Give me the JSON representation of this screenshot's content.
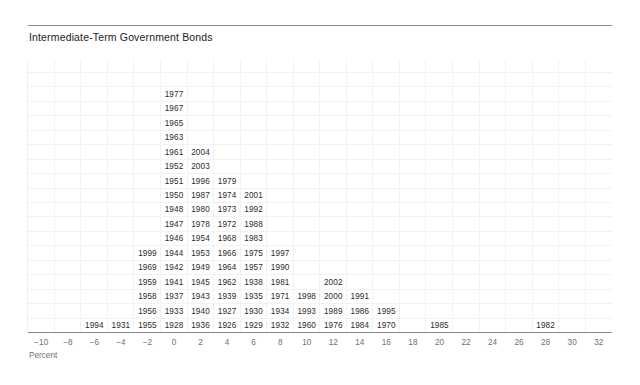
{
  "chart_title": "Intermediate-Term Government Bonds",
  "axis": {
    "caption": "Percent",
    "tick_labels": [
      "−10",
      "−8",
      "−6",
      "−4",
      "−2",
      "0",
      "2",
      "4",
      "6",
      "8",
      "10",
      "12",
      "14",
      "16",
      "18",
      "20",
      "22",
      "24",
      "26",
      "28",
      "30",
      "32"
    ],
    "min": -10,
    "max": 32,
    "step": 2
  },
  "colors": {
    "text": "#2b2b2b",
    "title": "#1c1c1c",
    "axis": "#888888",
    "tick": "#6f6f6f",
    "grid": "#f2f2f4",
    "background": "#ffffff"
  },
  "chart_data": {
    "type": "bar",
    "title": "Intermediate-Term Government Bonds",
    "subtitle": "",
    "xlabel": "Percent",
    "ylabel": "",
    "xlim": [
      -11,
      33
    ],
    "grid": true,
    "legend": "none",
    "note": "Stacked-year histogram: each annual return is printed as a year label stacked within its 2-percent-wide bin.",
    "bin_width": 2,
    "categories": [
      "−10",
      "−8",
      "−6",
      "−4",
      "−2",
      "0",
      "2",
      "4",
      "6",
      "8",
      "10",
      "12",
      "14",
      "16",
      "18",
      "20",
      "22",
      "24",
      "26",
      "28",
      "30",
      "32"
    ],
    "bin_centers": [
      -10,
      -8,
      -6,
      -4,
      -2,
      0,
      2,
      4,
      6,
      8,
      10,
      12,
      14,
      16,
      18,
      20,
      22,
      24,
      26,
      28,
      30,
      32
    ],
    "values": [
      0,
      0,
      1,
      1,
      7,
      17,
      11,
      10,
      8,
      7,
      5,
      4,
      3,
      2,
      1,
      0,
      1,
      0,
      0,
      0,
      0,
      1
    ],
    "bins": [
      {
        "center": -10,
        "years": []
      },
      {
        "center": -8,
        "years": []
      },
      {
        "center": -6,
        "years": [
          "1994"
        ]
      },
      {
        "center": -4,
        "years": [
          "1931"
        ]
      },
      {
        "center": -2,
        "years": [
          "1999",
          "1969",
          "1959",
          "1958",
          "1956",
          "1955"
        ]
      },
      {
        "center": 0,
        "years": [
          "1977",
          "1967",
          "1965",
          "1963",
          "1961",
          "1952",
          "1951",
          "1950",
          "1948",
          "1947",
          "1946",
          "1944",
          "1942",
          "1941",
          "1937",
          "1933",
          "1928"
        ]
      },
      {
        "center": 2,
        "years": [
          "2004",
          "2003",
          "1996",
          "1987",
          "1980",
          "1978",
          "1954",
          "1953",
          "1949",
          "1945",
          "1943",
          "1940",
          "1936"
        ]
      },
      {
        "center": 4,
        "years": [
          "1979",
          "1974",
          "1973",
          "1972",
          "1968",
          "1966",
          "1964",
          "1962",
          "1939",
          "1927",
          "1926"
        ]
      },
      {
        "center": 6,
        "years": [
          "2001",
          "1992",
          "1988",
          "1983",
          "1975",
          "1957",
          "1938",
          "1935",
          "1930",
          "1929"
        ]
      },
      {
        "center": 8,
        "years": [
          "1997",
          "1990",
          "1981",
          "1971",
          "1934",
          "1932"
        ]
      },
      {
        "center": 10,
        "years": [
          "1998",
          "1993",
          "1960"
        ]
      },
      {
        "center": 12,
        "years": [
          "2002",
          "2000",
          "1989",
          "1976"
        ]
      },
      {
        "center": 14,
        "years": [
          "1991",
          "1986",
          "1984"
        ]
      },
      {
        "center": 16,
        "years": [
          "1995",
          "1970"
        ]
      },
      {
        "center": 18,
        "years": []
      },
      {
        "center": 20,
        "years": [
          "1985"
        ]
      },
      {
        "center": 22,
        "years": []
      },
      {
        "center": 24,
        "years": []
      },
      {
        "center": 26,
        "years": []
      },
      {
        "center": 28,
        "years": [
          "1982"
        ]
      },
      {
        "center": 30,
        "years": []
      },
      {
        "center": 32,
        "years": []
      }
    ]
  }
}
